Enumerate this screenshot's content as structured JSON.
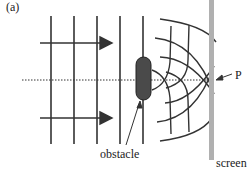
{
  "figure": {
    "panel_label": "(a)",
    "labels": {
      "point": "P",
      "obstacle": "obstacle",
      "screen": "screen"
    },
    "colors": {
      "lines": "#333333",
      "obstacle_fill": "#4a4a4a",
      "screen": "#b0b0b0"
    }
  }
}
